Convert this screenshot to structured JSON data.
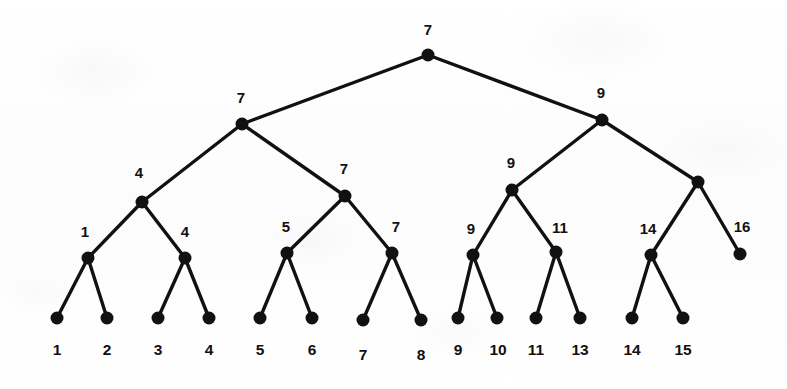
{
  "figure": {
    "width": 787,
    "height": 389,
    "background_color": "#fdfdfd",
    "ink_color": "#111111"
  },
  "style": {
    "node_radius": 6.5,
    "leaf_radius": 6.5,
    "edge_width": 3.4
  },
  "chart_data": {
    "type": "diagram",
    "subtype": "binary-tree",
    "node_count": 29,
    "leaf_count": 14,
    "depth": 4,
    "nodes": [
      {
        "id": "root",
        "label": "7",
        "x": 428,
        "y": 55,
        "level": 0,
        "is_leaf": false,
        "label_x": 428,
        "label_y": 29
      },
      {
        "id": "n-l",
        "label": "7",
        "x": 242,
        "y": 124,
        "level": 1,
        "is_leaf": false,
        "label_x": 241,
        "label_y": 97
      },
      {
        "id": "n-r",
        "label": "9",
        "x": 602,
        "y": 120,
        "level": 1,
        "is_leaf": false,
        "label_x": 601,
        "label_y": 92
      },
      {
        "id": "n-ll",
        "label": "4",
        "x": 142,
        "y": 202,
        "level": 2,
        "is_leaf": false,
        "label_x": 139,
        "label_y": 172
      },
      {
        "id": "n-lr",
        "label": "7",
        "x": 345,
        "y": 196,
        "level": 2,
        "is_leaf": false,
        "label_x": 344,
        "label_y": 168
      },
      {
        "id": "n-rl",
        "label": "9",
        "x": 512,
        "y": 190,
        "level": 2,
        "is_leaf": false,
        "label_x": 511,
        "label_y": 162
      },
      {
        "id": "n-rr",
        "label": "",
        "x": 698,
        "y": 182,
        "level": 2,
        "is_leaf": false,
        "label_x": 698,
        "label_y": 182
      },
      {
        "id": "n-lll",
        "label": "1",
        "x": 88,
        "y": 258,
        "level": 3,
        "is_leaf": false,
        "label_x": 85,
        "label_y": 231
      },
      {
        "id": "n-llr",
        "label": "4",
        "x": 185,
        "y": 258,
        "level": 3,
        "is_leaf": false,
        "label_x": 185,
        "label_y": 231
      },
      {
        "id": "n-lrl",
        "label": "5",
        "x": 287,
        "y": 253,
        "level": 3,
        "is_leaf": false,
        "label_x": 286,
        "label_y": 226
      },
      {
        "id": "n-lrr",
        "label": "7",
        "x": 392,
        "y": 253,
        "level": 3,
        "is_leaf": false,
        "label_x": 396,
        "label_y": 226
      },
      {
        "id": "n-rll",
        "label": "9",
        "x": 473,
        "y": 255,
        "level": 3,
        "is_leaf": false,
        "label_x": 471,
        "label_y": 228
      },
      {
        "id": "n-rlr",
        "label": "11",
        "x": 556,
        "y": 252,
        "level": 3,
        "is_leaf": false,
        "label_x": 560,
        "label_y": 227
      },
      {
        "id": "n-rrl",
        "label": "14",
        "x": 651,
        "y": 255,
        "level": 3,
        "is_leaf": false,
        "label_x": 648,
        "label_y": 228
      },
      {
        "id": "n-rrr",
        "label": "16",
        "x": 740,
        "y": 254,
        "level": 3,
        "is_leaf": true,
        "label_x": 742,
        "label_y": 226
      }
    ],
    "leaves": [
      {
        "id": "leaf-1",
        "label": "1",
        "x": 57,
        "y": 318,
        "label_x": 57,
        "label_y": 350,
        "parent": "n-lll"
      },
      {
        "id": "leaf-2",
        "label": "2",
        "x": 107,
        "y": 318,
        "label_x": 107,
        "label_y": 350,
        "parent": "n-lll"
      },
      {
        "id": "leaf-3",
        "label": "3",
        "x": 158,
        "y": 318,
        "label_x": 158,
        "label_y": 350,
        "parent": "n-llr"
      },
      {
        "id": "leaf-4",
        "label": "4",
        "x": 209,
        "y": 318,
        "label_x": 209,
        "label_y": 350,
        "parent": "n-llr"
      },
      {
        "id": "leaf-5",
        "label": "5",
        "x": 260,
        "y": 318,
        "label_x": 260,
        "label_y": 350,
        "parent": "n-lrl"
      },
      {
        "id": "leaf-6",
        "label": "6",
        "x": 312,
        "y": 318,
        "label_x": 312,
        "label_y": 350,
        "parent": "n-lrl"
      },
      {
        "id": "leaf-7",
        "label": "7",
        "x": 363,
        "y": 320,
        "label_x": 363,
        "label_y": 355,
        "parent": "n-lrr"
      },
      {
        "id": "leaf-8",
        "label": "8",
        "x": 421,
        "y": 320,
        "label_x": 421,
        "label_y": 355,
        "parent": "n-lrr"
      },
      {
        "id": "leaf-9",
        "label": "9",
        "x": 458,
        "y": 318,
        "label_x": 458,
        "label_y": 350,
        "parent": "n-rll"
      },
      {
        "id": "leaf-10",
        "label": "10",
        "x": 497,
        "y": 318,
        "label_x": 498,
        "label_y": 350,
        "parent": "n-rll"
      },
      {
        "id": "leaf-11",
        "label": "11",
        "x": 536,
        "y": 318,
        "label_x": 536,
        "label_y": 350,
        "parent": "n-rlr"
      },
      {
        "id": "leaf-13",
        "label": "13",
        "x": 580,
        "y": 318,
        "label_x": 580,
        "label_y": 350,
        "parent": "n-rlr"
      },
      {
        "id": "leaf-14",
        "label": "14",
        "x": 632,
        "y": 318,
        "label_x": 632,
        "label_y": 350,
        "parent": "n-rrl"
      },
      {
        "id": "leaf-15",
        "label": "15",
        "x": 683,
        "y": 318,
        "label_x": 683,
        "label_y": 350,
        "parent": "n-rrl"
      }
    ],
    "edges": [
      {
        "from": "root",
        "to": "n-l"
      },
      {
        "from": "root",
        "to": "n-r"
      },
      {
        "from": "n-l",
        "to": "n-ll"
      },
      {
        "from": "n-l",
        "to": "n-lr"
      },
      {
        "from": "n-r",
        "to": "n-rl"
      },
      {
        "from": "n-r",
        "to": "n-rr"
      },
      {
        "from": "n-ll",
        "to": "n-lll"
      },
      {
        "from": "n-ll",
        "to": "n-llr"
      },
      {
        "from": "n-lr",
        "to": "n-lrl"
      },
      {
        "from": "n-lr",
        "to": "n-lrr"
      },
      {
        "from": "n-rl",
        "to": "n-rll"
      },
      {
        "from": "n-rl",
        "to": "n-rlr"
      },
      {
        "from": "n-rr",
        "to": "n-rrl"
      },
      {
        "from": "n-rr",
        "to": "n-rrr"
      },
      {
        "from": "n-lll",
        "to": "leaf-1"
      },
      {
        "from": "n-lll",
        "to": "leaf-2"
      },
      {
        "from": "n-llr",
        "to": "leaf-3"
      },
      {
        "from": "n-llr",
        "to": "leaf-4"
      },
      {
        "from": "n-lrl",
        "to": "leaf-5"
      },
      {
        "from": "n-lrl",
        "to": "leaf-6"
      },
      {
        "from": "n-lrr",
        "to": "leaf-7"
      },
      {
        "from": "n-lrr",
        "to": "leaf-8"
      },
      {
        "from": "n-rll",
        "to": "leaf-9"
      },
      {
        "from": "n-rll",
        "to": "leaf-10"
      },
      {
        "from": "n-rlr",
        "to": "leaf-11"
      },
      {
        "from": "n-rlr",
        "to": "leaf-13"
      },
      {
        "from": "n-rrl",
        "to": "leaf-14"
      },
      {
        "from": "n-rrl",
        "to": "leaf-15"
      }
    ],
    "leaf_sequence": [
      "1",
      "2",
      "3",
      "4",
      "5",
      "6",
      "7",
      "8",
      "9",
      "10",
      "11",
      "13",
      "14",
      "15"
    ],
    "internal_labels": [
      "7",
      "7",
      "9",
      "4",
      "7",
      "9",
      "1",
      "4",
      "5",
      "7",
      "9",
      "11",
      "14",
      "16"
    ]
  }
}
